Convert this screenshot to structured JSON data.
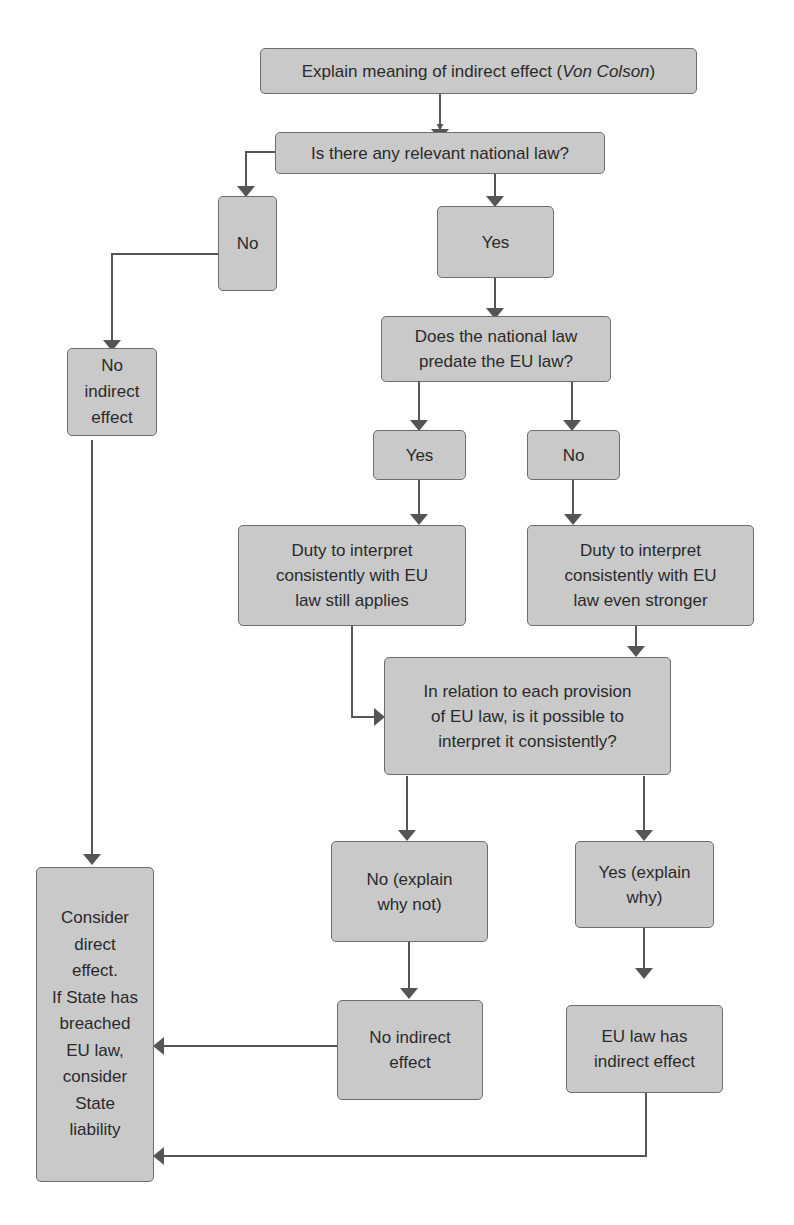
{
  "diagram": {
    "type": "flowchart",
    "colors": {
      "box_fill": "#c9c9c9",
      "box_border": "#6e6e6e",
      "connector": "#555555",
      "text": "#2a2a2a",
      "background": "#ffffff"
    },
    "nodes": {
      "start": {
        "text_before": "Explain meaning of indirect effect (",
        "text_italic": "Von Colson",
        "text_after": ")"
      },
      "q_national_law": {
        "text": "Is there any relevant national law?"
      },
      "no_national_law": {
        "text": "No"
      },
      "yes_national_law": {
        "text": "Yes"
      },
      "no_indirect_effect_left": {
        "lines": [
          "No",
          "indirect",
          "effect"
        ]
      },
      "q_predate": {
        "lines": [
          "Does the national law",
          "predate the EU law?"
        ]
      },
      "predate_yes": {
        "text": "Yes"
      },
      "predate_no": {
        "text": "No"
      },
      "duty_applies": {
        "lines": [
          "Duty to interpret",
          "consistently with EU",
          "law still applies"
        ]
      },
      "duty_stronger": {
        "lines": [
          "Duty to interpret",
          "consistently with EU",
          "law even stronger"
        ]
      },
      "q_possible": {
        "lines": [
          "In relation to each provision",
          "of EU law, is it possible to",
          "interpret it consistently?"
        ]
      },
      "possible_no": {
        "lines": [
          "No (explain",
          "why not)"
        ]
      },
      "possible_yes": {
        "lines": [
          "Yes (explain",
          "why)"
        ]
      },
      "no_indirect_effect": {
        "lines": [
          "No indirect",
          "effect"
        ]
      },
      "has_indirect_effect": {
        "lines": [
          "EU law has",
          "indirect effect"
        ]
      },
      "consider_direct": {
        "lines": [
          "Consider",
          "direct",
          "effect.",
          "If State has",
          "breached",
          "EU law,",
          "consider",
          "State",
          "liability"
        ]
      }
    },
    "edges": [
      {
        "from": "start",
        "to": "q_national_law"
      },
      {
        "from": "q_national_law",
        "to": "no_national_law"
      },
      {
        "from": "q_national_law",
        "to": "yes_national_law"
      },
      {
        "from": "no_national_law",
        "to": "no_indirect_effect_left"
      },
      {
        "from": "yes_national_law",
        "to": "q_predate"
      },
      {
        "from": "q_predate",
        "to": "predate_yes"
      },
      {
        "from": "q_predate",
        "to": "predate_no"
      },
      {
        "from": "predate_yes",
        "to": "duty_applies"
      },
      {
        "from": "predate_no",
        "to": "duty_stronger"
      },
      {
        "from": "duty_applies",
        "to": "q_possible"
      },
      {
        "from": "duty_stronger",
        "to": "q_possible"
      },
      {
        "from": "q_possible",
        "to": "possible_no"
      },
      {
        "from": "q_possible",
        "to": "possible_yes"
      },
      {
        "from": "possible_no",
        "to": "no_indirect_effect"
      },
      {
        "from": "possible_yes",
        "to": "has_indirect_effect"
      },
      {
        "from": "no_indirect_effect_left",
        "to": "consider_direct"
      },
      {
        "from": "no_indirect_effect",
        "to": "consider_direct"
      },
      {
        "from": "has_indirect_effect",
        "to": "consider_direct"
      }
    ]
  }
}
